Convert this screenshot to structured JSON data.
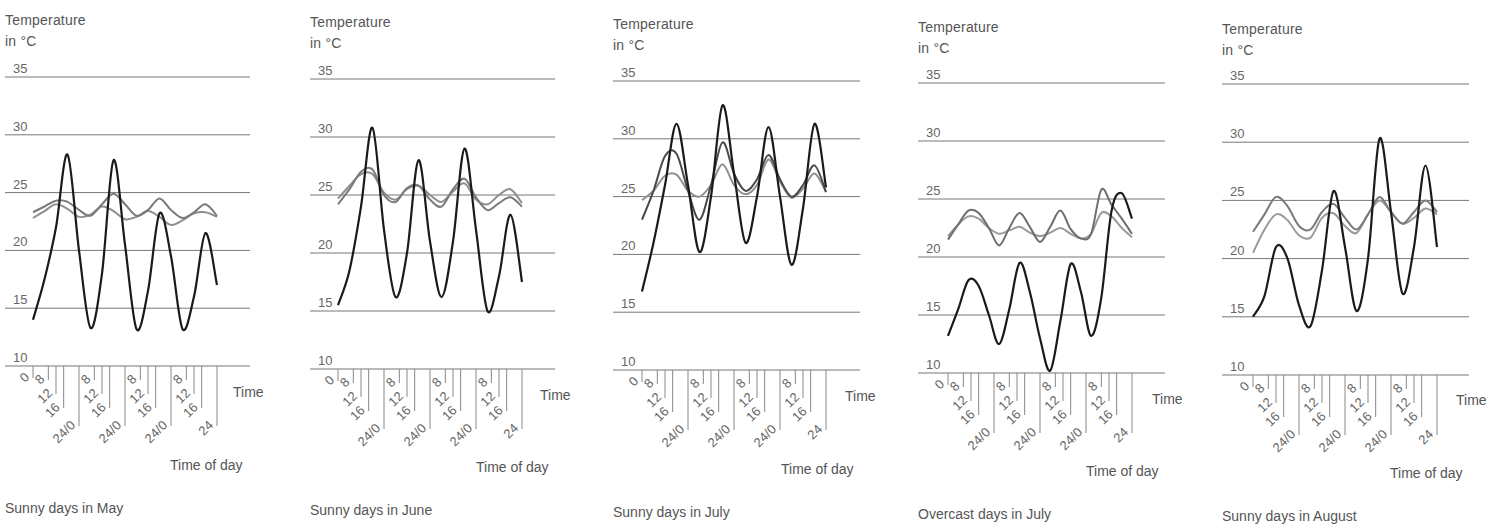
{
  "chart_data": [
    {
      "type": "line",
      "title": "Sunny days in May",
      "ylabel": "Temperature in °C",
      "xlabel": "Time of day",
      "x_axis_name": "Time",
      "ylim": [
        10,
        35
      ],
      "yticks": [
        10,
        15,
        20,
        25,
        30,
        35
      ],
      "xticks": [
        "0",
        "8",
        "12",
        "16",
        "24/0",
        "8",
        "12",
        "16",
        "24/0",
        "8",
        "12",
        "16",
        "24/0",
        "8",
        "12",
        "16",
        "24"
      ],
      "x_hours": [
        0,
        4,
        8,
        12,
        16,
        20,
        24,
        28,
        32,
        36,
        40,
        44,
        48,
        52,
        56,
        60,
        64,
        68,
        72,
        76,
        80,
        84,
        88,
        92,
        96
      ],
      "grid": true,
      "series": [
        {
          "name": "outside air",
          "color": "#1a1a1a",
          "values": [
            14.0,
            17.5,
            22.0,
            28.3,
            20.0,
            13.3,
            18.0,
            27.8,
            20.5,
            13.2,
            16.5,
            23.2,
            19.5,
            13.2,
            16.0,
            21.5,
            17.0,
            null,
            null,
            null,
            null,
            null,
            null,
            null,
            null
          ]
        },
        {
          "name": "room A",
          "color": "#7a7a7a",
          "values": [
            23.3,
            23.8,
            24.3,
            24.2,
            23.5,
            23.0,
            24.0,
            24.9,
            24.0,
            23.0,
            23.5,
            24.5,
            23.5,
            22.8,
            23.3,
            24.0,
            23.0,
            null,
            null,
            null,
            null,
            null,
            null,
            null,
            null
          ]
        },
        {
          "name": "room B",
          "color": "#8e8e8e",
          "values": [
            22.8,
            23.4,
            24.0,
            23.6,
            22.9,
            23.1,
            23.8,
            23.4,
            22.7,
            22.9,
            23.4,
            22.9,
            22.2,
            22.6,
            23.2,
            23.3,
            22.9,
            null,
            null,
            null,
            null,
            null,
            null,
            null,
            null
          ]
        }
      ]
    },
    {
      "type": "line",
      "title": "Sunny days in June",
      "ylabel": "Temperature in °C",
      "xlabel": "Time of day",
      "x_axis_name": "Time",
      "ylim": [
        10,
        35
      ],
      "yticks": [
        10,
        15,
        20,
        25,
        30,
        35
      ],
      "xticks": [
        "0",
        "8",
        "12",
        "16",
        "24/0",
        "8",
        "12",
        "16",
        "24/0",
        "8",
        "12",
        "16",
        "24/0",
        "8",
        "12",
        "16",
        "24"
      ],
      "grid": true,
      "series": [
        {
          "name": "outside air",
          "color": "#1a1a1a",
          "values": [
            15.5,
            18.5,
            24.0,
            30.8,
            22.0,
            16.2,
            20.0,
            28.0,
            21.0,
            16.2,
            21.0,
            29.0,
            22.0,
            15.0,
            18.0,
            23.3,
            17.5
          ]
        },
        {
          "name": "room A",
          "color": "#7a7a7a",
          "values": [
            24.2,
            25.5,
            27.0,
            27.2,
            25.0,
            24.4,
            25.6,
            25.8,
            24.6,
            24.0,
            25.5,
            26.4,
            24.8,
            23.7,
            24.3,
            24.8,
            24.0
          ]
        },
        {
          "name": "room B",
          "color": "#8e8e8e",
          "values": [
            24.7,
            25.8,
            26.8,
            26.8,
            25.2,
            24.6,
            25.5,
            25.8,
            25.0,
            24.4,
            25.3,
            26.0,
            24.6,
            24.2,
            25.0,
            25.5,
            24.3
          ]
        }
      ]
    },
    {
      "type": "line",
      "title": "Sunny days in July",
      "ylabel": "Temperature in °C",
      "xlabel": "Time of day",
      "x_axis_name": "Time",
      "ylim": [
        10,
        35
      ],
      "yticks": [
        10,
        15,
        20,
        25,
        30,
        35
      ],
      "xticks": [
        "0",
        "8",
        "12",
        "16",
        "24/0",
        "8",
        "12",
        "16",
        "24/0",
        "8",
        "12",
        "16",
        "24/0",
        "8",
        "12",
        "16",
        "24"
      ],
      "grid": true,
      "series": [
        {
          "name": "outside air",
          "color": "#1a1a1a",
          "values": [
            16.8,
            21.0,
            26.0,
            31.3,
            26.0,
            20.2,
            25.0,
            32.9,
            27.0,
            21.0,
            25.0,
            31.0,
            25.0,
            19.1,
            24.0,
            31.3,
            25.8
          ]
        },
        {
          "name": "room A",
          "color": "#4a4a4a",
          "values": [
            23.0,
            25.5,
            28.5,
            28.7,
            25.5,
            23.0,
            26.0,
            29.7,
            27.0,
            25.5,
            26.5,
            28.6,
            26.5,
            25.0,
            26.0,
            27.7,
            25.4
          ]
        },
        {
          "name": "room B",
          "color": "#8e8e8e",
          "values": [
            24.7,
            25.5,
            26.8,
            26.9,
            25.5,
            25.0,
            26.0,
            27.8,
            26.0,
            25.2,
            26.0,
            28.2,
            26.3,
            24.9,
            25.7,
            27.0,
            25.4
          ]
        }
      ]
    },
    {
      "type": "line",
      "title": "Overcast days in July",
      "ylabel": "Temperature in °C",
      "xlabel": "Time of day",
      "x_axis_name": "Time",
      "ylim": [
        10,
        35
      ],
      "yticks": [
        10,
        15,
        20,
        25,
        30,
        35
      ],
      "xticks": [
        "0",
        "8",
        "12",
        "16",
        "24/0",
        "8",
        "12",
        "16",
        "24/0",
        "8",
        "12",
        "16",
        "24/0",
        "8",
        "12",
        "16",
        "24"
      ],
      "grid": true,
      "series": [
        {
          "name": "outside air",
          "color": "#1a1a1a",
          "values": [
            13.2,
            15.5,
            18.0,
            17.5,
            15.0,
            12.5,
            15.5,
            19.5,
            17.0,
            13.0,
            10.2,
            14.5,
            19.4,
            17.0,
            13.2,
            16.5,
            24.0,
            25.5,
            23.3
          ]
        },
        {
          "name": "room A",
          "color": "#6e6e6e",
          "values": [
            21.5,
            22.8,
            24.0,
            23.8,
            22.5,
            21.0,
            22.5,
            23.8,
            22.6,
            21.3,
            22.6,
            24.0,
            22.4,
            21.6,
            22.0,
            25.8,
            24.5,
            23.3,
            22.0
          ]
        },
        {
          "name": "room B",
          "color": "#9a9a9a",
          "values": [
            21.8,
            22.8,
            23.5,
            23.3,
            22.5,
            22.0,
            22.3,
            22.6,
            22.1,
            21.8,
            22.1,
            22.5,
            22.0,
            21.6,
            22.0,
            23.8,
            23.5,
            22.5,
            21.7
          ]
        }
      ]
    },
    {
      "type": "line",
      "title": "Sunny days in August",
      "ylabel": "Temperature in °C",
      "xlabel": "Time of day",
      "x_axis_name": "Time",
      "ylim": [
        10,
        35
      ],
      "yticks": [
        10,
        15,
        20,
        25,
        30,
        35
      ],
      "xticks": [
        "0",
        "8",
        "12",
        "16",
        "24/0",
        "8",
        "12",
        "16",
        "24/0",
        "8",
        "12",
        "16",
        "24/0",
        "8",
        "12",
        "16",
        "24"
      ],
      "grid": true,
      "series": [
        {
          "name": "outside air",
          "color": "#1a1a1a",
          "values": [
            15.0,
            16.8,
            21.0,
            20.0,
            16.0,
            14.2,
            19.0,
            25.8,
            21.0,
            15.5,
            20.0,
            30.3,
            24.0,
            17.0,
            21.0,
            28.0,
            21.0
          ]
        },
        {
          "name": "room A",
          "color": "#7a7a7a",
          "values": [
            22.3,
            23.8,
            25.3,
            24.5,
            22.8,
            22.5,
            24.0,
            24.7,
            23.5,
            22.5,
            23.8,
            25.3,
            24.0,
            23.0,
            24.0,
            25.0,
            24.0
          ]
        },
        {
          "name": "room B",
          "color": "#9a9a9a",
          "values": [
            20.5,
            22.5,
            23.8,
            23.3,
            22.0,
            21.8,
            23.5,
            23.9,
            22.8,
            22.2,
            23.8,
            25.0,
            24.0,
            23.0,
            23.5,
            24.3,
            23.8
          ]
        }
      ]
    }
  ],
  "panels": [
    {
      "ylabel_line1": "Temperature",
      "ylabel_line2": "in °C",
      "x_axis_name": "Time",
      "xlabel": "Time of day",
      "caption": "Sunny days in May"
    },
    {
      "ylabel_line1": "Temperature",
      "ylabel_line2": "in °C",
      "x_axis_name": "Time",
      "xlabel": "Time of day",
      "caption": "Sunny days in June"
    },
    {
      "ylabel_line1": "Temperature",
      "ylabel_line2": "in °C",
      "x_axis_name": "Time",
      "xlabel": "Time of day",
      "caption": "Sunny days in July"
    },
    {
      "ylabel_line1": "Temperature",
      "ylabel_line2": "in °C",
      "x_axis_name": "Time",
      "xlabel": "Time of day",
      "caption": "Overcast days in July"
    },
    {
      "ylabel_line1": "Temperature",
      "ylabel_line2": "in °C",
      "x_axis_name": "Time",
      "xlabel": "Time of day",
      "caption": "Sunny days in August"
    }
  ],
  "layout": [
    {
      "left": 0,
      "gridLeft": 5,
      "gridRight": 250,
      "y10": 366,
      "y35": 77,
      "x0": 33,
      "ylabTop": 10,
      "timeX": 233,
      "timeY": 384,
      "todX": 170,
      "todY": 457,
      "capY": 500
    },
    {
      "left": 305,
      "gridLeft": 5,
      "gridRight": 250,
      "y10": 369,
      "y35": 79,
      "x0": 33,
      "ylabTop": 12,
      "timeX": 235,
      "timeY": 387,
      "todX": 171,
      "todY": 459,
      "capY": 502
    },
    {
      "left": 608,
      "gridLeft": 5,
      "gridRight": 252,
      "y10": 370,
      "y35": 81,
      "x0": 34,
      "ylabTop": 14,
      "timeX": 237,
      "timeY": 388,
      "todX": 173,
      "todY": 461,
      "capY": 504
    },
    {
      "left": 913,
      "gridLeft": 5,
      "gridRight": 252,
      "y10": 373,
      "y35": 83,
      "x0": 35,
      "ylabTop": 17,
      "timeX": 239,
      "timeY": 391,
      "todX": 173,
      "todY": 463,
      "capY": 506
    },
    {
      "left": 1217,
      "gridLeft": 5,
      "gridRight": 252,
      "y10": 375,
      "y35": 84,
      "x0": 36,
      "ylabTop": 19,
      "timeX": 239,
      "timeY": 392,
      "todX": 173,
      "todY": 465,
      "capY": 508
    }
  ]
}
